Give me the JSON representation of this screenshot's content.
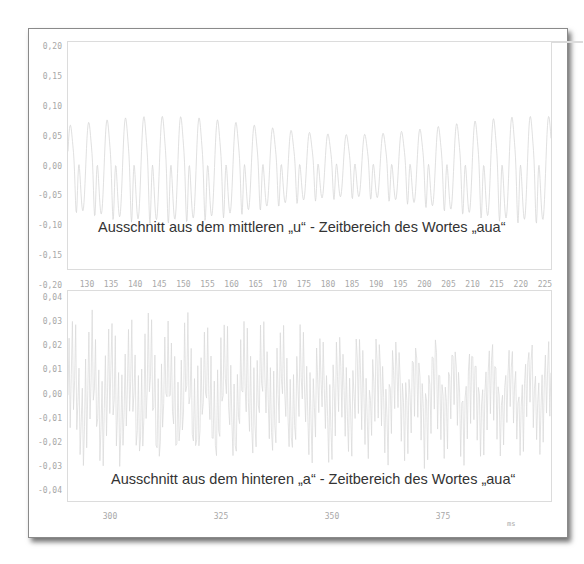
{
  "figure": {
    "top_panel": {
      "caption": "Ausschnitt aus dem mittleren „u“ - Zeitbereich des Wortes „aua“",
      "y_ticks": [
        "0,20",
        "0,15",
        "0,10",
        "0,05",
        "0,00",
        "-0,05",
        "-0,10",
        "-0,15",
        "-0,20"
      ],
      "x_ticks": [
        "130",
        "135",
        "140",
        "145",
        "150",
        "155",
        "160",
        "165",
        "170",
        "175",
        "180",
        "185",
        "190",
        "195",
        "200",
        "205",
        "210",
        "215",
        "220",
        "225"
      ],
      "x_unit": "ms"
    },
    "bottom_panel": {
      "caption": "Ausschnitt aus dem hinteren „a“ - Zeitbereich des Wortes „aua“",
      "y_ticks": [
        "0,04",
        "0,03",
        "0,02",
        "0,01",
        "0,00",
        "-0,01",
        "-0,02",
        "-0,03",
        "-0,04"
      ],
      "x_ticks": [
        "300",
        "325",
        "350",
        "375"
      ],
      "x_unit": "ms"
    },
    "colors": {
      "waveform": "#d8d8d8",
      "axis_text": "#a8a8a8",
      "caption": "#333333",
      "frame": "#8a8a8a"
    }
  },
  "chart_data": [
    {
      "type": "line",
      "title": "Ausschnitt aus dem mittleren „u“ - Zeitbereich des Wortes „aua“",
      "xlabel": "ms",
      "ylabel": "",
      "xlim": [
        126,
        226
      ],
      "ylim": [
        -0.2,
        0.2
      ],
      "x_ticks": [
        130,
        135,
        140,
        145,
        150,
        155,
        160,
        165,
        170,
        175,
        180,
        185,
        190,
        195,
        200,
        205,
        210,
        215,
        220,
        225
      ],
      "y_ticks": [
        0.2,
        0.15,
        0.1,
        0.05,
        0.0,
        -0.05,
        -0.1,
        -0.15,
        -0.2
      ],
      "grid": false,
      "description": "Periodic vowel waveform with ~26 pitch periods (~3.8 ms period), peaks ~0.08–0.13, troughs ~-0.10 to -0.16",
      "series": [
        {
          "name": "u-waveform",
          "approx_peak_max": 0.13,
          "approx_trough_min": -0.16,
          "approx_period_ms": 3.8
        }
      ]
    },
    {
      "type": "line",
      "title": "Ausschnitt aus dem hinteren „a“ - Zeitbereich des Wortes „aua“",
      "xlabel": "ms",
      "ylabel": "",
      "xlim": [
        290,
        400
      ],
      "ylim": [
        -0.04,
        0.04
      ],
      "x_ticks": [
        300,
        325,
        350,
        375
      ],
      "y_ticks": [
        0.04,
        0.03,
        0.02,
        0.01,
        0.0,
        -0.01,
        -0.02,
        -0.03,
        -0.04
      ],
      "grid": false,
      "description": "Dense high-frequency vowel waveform, amplitude ~±0.035 decreasing to ~±0.025",
      "series": [
        {
          "name": "a-waveform",
          "approx_peak_max": 0.035,
          "approx_trough_min": -0.032
        }
      ]
    }
  ]
}
